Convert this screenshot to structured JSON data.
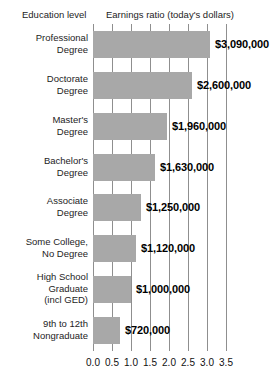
{
  "headers": {
    "left": "Education level",
    "right": "Earnings ratio (today's dollars)"
  },
  "style": {
    "bar_color": "#a8a8a8",
    "gridline_color": "#8f8f8f",
    "background": "#ffffff",
    "text_color": "#1d1d1d"
  },
  "chart_data": {
    "type": "bar",
    "orientation": "horizontal",
    "title": "Earnings ratio (today's dollars)",
    "xlabel": "",
    "ylabel": "Education level",
    "xlim": [
      0.0,
      3.5
    ],
    "grid": true,
    "legend": "none",
    "categories": [
      "Professional Degree",
      "Doctorate Degree",
      "Master's Degree",
      "Bachelor's Degree",
      "Associate Degree",
      "Some College, No Degree",
      "High School Graduate (incl GED)",
      "9th to 12th Nongraduate"
    ],
    "category_lines": [
      [
        "Professional",
        "Degree"
      ],
      [
        "Doctorate",
        "Degree"
      ],
      [
        "Master's",
        "Degree"
      ],
      [
        "Bachelor's",
        "Degree"
      ],
      [
        "Associate",
        "Degree"
      ],
      [
        "Some College,",
        "No Degree"
      ],
      [
        "High School",
        "Graduate",
        "(incl GED)"
      ],
      [
        "9th to 12th",
        "Nongraduate"
      ]
    ],
    "values": [
      3.09,
      2.6,
      1.96,
      1.63,
      1.25,
      1.12,
      1.0,
      0.72
    ],
    "data_labels": [
      "$3,090,000",
      "$2,600,000",
      "$1,960,000",
      "$1,630,000",
      "$1,250,000",
      "$1,120,000",
      "$1,000,000",
      "$720,000"
    ],
    "xticks": [
      0.0,
      0.5,
      1.0,
      1.5,
      2.0,
      2.5,
      3.0,
      3.5
    ],
    "xtick_labels": [
      "0.0",
      "0.5",
      "1.0",
      "1.5",
      "2.0",
      "2.5",
      "3.0",
      "3.5"
    ]
  }
}
